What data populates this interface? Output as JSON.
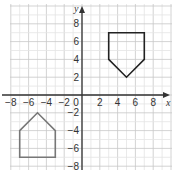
{
  "diagram": {
    "type": "coordinate-grid",
    "axes": {
      "x_label": "x",
      "y_label": "y",
      "x_range": [
        -8,
        9
      ],
      "y_range": [
        -9,
        10
      ],
      "x_ticks": [
        {
          "value": -8,
          "label": "−8"
        },
        {
          "value": -6,
          "label": "−6"
        },
        {
          "value": -4,
          "label": "−4"
        },
        {
          "value": -2,
          "label": "−2"
        },
        {
          "value": 0,
          "label": "0"
        },
        {
          "value": 2,
          "label": "2"
        },
        {
          "value": 4,
          "label": "4"
        },
        {
          "value": 6,
          "label": "6"
        },
        {
          "value": 8,
          "label": "8"
        }
      ],
      "y_ticks": [
        {
          "value": 8,
          "label": "8"
        },
        {
          "value": 6,
          "label": "6"
        },
        {
          "value": 4,
          "label": "4"
        },
        {
          "value": 2,
          "label": "2"
        },
        {
          "value": -2,
          "label": "−2"
        },
        {
          "value": -4,
          "label": "−4"
        },
        {
          "value": -6,
          "label": "−6"
        },
        {
          "value": -8,
          "label": "−8"
        }
      ]
    },
    "shapes": [
      {
        "name": "pentagon-upper",
        "points": [
          [
            3,
            7
          ],
          [
            7,
            7
          ],
          [
            7,
            4
          ],
          [
            5,
            2
          ],
          [
            3,
            4
          ]
        ],
        "stroke": "#222222"
      },
      {
        "name": "pentagon-lower",
        "points": [
          [
            -7,
            -7
          ],
          [
            -3,
            -7
          ],
          [
            -3,
            -4
          ],
          [
            -5,
            -2
          ],
          [
            -7,
            -4
          ]
        ],
        "stroke": "#777777"
      }
    ],
    "colors": {
      "minor_grid": "#e4e4e4",
      "major_grid": "#c8c8c8",
      "axis": "#333333"
    }
  }
}
